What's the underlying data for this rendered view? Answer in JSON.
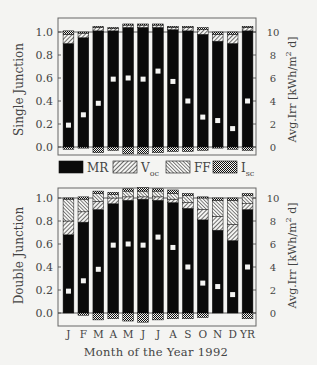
{
  "chart_data": [
    {
      "type": "bar",
      "stacked": true,
      "panel": "top",
      "ylabel": "Single Junction",
      "y2label": "Avg.Irr [kWh/m^2 d]",
      "ylim": [
        0.0,
        1.0
      ],
      "y2lim": [
        0,
        10
      ],
      "yticks": [
        "0.0",
        "0.2",
        "0.4",
        "0.6",
        "0.8",
        "1.0"
      ],
      "y2ticks": [
        "0",
        "2",
        "4",
        "6",
        "8",
        "10"
      ],
      "categories": [
        "J",
        "F",
        "M",
        "A",
        "M",
        "J",
        "J",
        "A",
        "S",
        "O",
        "N",
        "D",
        "YR"
      ],
      "series": [
        {
          "name": "MR",
          "values": [
            0.9,
            0.95,
            1.01,
            1.01,
            1.04,
            1.04,
            1.04,
            1.02,
            1.01,
            0.98,
            0.92,
            0.9,
            1.01
          ]
        },
        {
          "name": "Voc",
          "values": [
            0.08,
            0.04,
            0.03,
            0.02,
            0.02,
            0.02,
            0.02,
            0.02,
            0.03,
            0.04,
            0.06,
            0.08,
            0.03
          ]
        },
        {
          "name": "FF",
          "values": [
            0.0,
            0.0,
            0.0,
            0.0,
            0.0,
            0.0,
            0.0,
            0.0,
            0.0,
            0.0,
            0.0,
            0.0,
            0.0
          ]
        },
        {
          "name": "Isc",
          "values": [
            0.03,
            0.01,
            0.01,
            0.01,
            0.01,
            0.01,
            0.01,
            0.01,
            0.01,
            0.02,
            0.02,
            0.02,
            0.01
          ]
        },
        {
          "name": "Isc_below",
          "values": [
            -0.02,
            -0.01,
            -0.05,
            -0.03,
            -0.06,
            -0.06,
            -0.05,
            -0.04,
            -0.04,
            -0.03,
            -0.01,
            -0.02,
            -0.03
          ]
        }
      ],
      "irradiance": [
        1.9,
        2.8,
        3.8,
        5.9,
        6.0,
        5.9,
        6.6,
        5.7,
        4.0,
        2.6,
        2.3,
        1.6,
        4.0
      ]
    },
    {
      "type": "bar",
      "stacked": true,
      "panel": "bottom",
      "ylabel": "Double Junction",
      "y2label": "Avg.Irr [kWh/m^2 d]",
      "ylim": [
        0.0,
        1.0
      ],
      "y2lim": [
        0,
        10
      ],
      "yticks": [
        "0.0",
        "0.2",
        "0.4",
        "0.6",
        "0.8",
        "1.0"
      ],
      "y2ticks": [
        "0",
        "2",
        "4",
        "6",
        "8",
        "10"
      ],
      "categories": [
        "J",
        "F",
        "M",
        "A",
        "M",
        "J",
        "J",
        "A",
        "S",
        "O",
        "N",
        "D",
        "YR"
      ],
      "series": [
        {
          "name": "MR",
          "values": [
            0.68,
            0.79,
            0.9,
            0.95,
            0.98,
            0.99,
            0.98,
            0.96,
            0.91,
            0.81,
            0.72,
            0.63,
            0.9
          ]
        },
        {
          "name": "Voc",
          "values": [
            0.12,
            0.09,
            0.07,
            0.05,
            0.03,
            0.02,
            0.03,
            0.03,
            0.05,
            0.09,
            0.12,
            0.14,
            0.05
          ]
        },
        {
          "name": "FF",
          "values": [
            0.19,
            0.11,
            0.07,
            0.03,
            0.05,
            0.05,
            0.05,
            0.05,
            0.06,
            0.1,
            0.14,
            0.21,
            0.07
          ]
        },
        {
          "name": "Isc",
          "values": [
            0.01,
            0.02,
            0.02,
            0.02,
            0.02,
            0.03,
            0.02,
            0.03,
            0.02,
            0.01,
            0.02,
            0.02,
            0.02
          ]
        },
        {
          "name": "Isc_below",
          "values": [
            0.0,
            -0.02,
            -0.06,
            -0.05,
            -0.07,
            -0.08,
            -0.06,
            -0.05,
            -0.05,
            -0.04,
            0.0,
            0.0,
            -0.05
          ]
        }
      ],
      "irradiance": [
        1.9,
        2.8,
        3.8,
        5.9,
        6.0,
        5.9,
        6.6,
        5.7,
        4.0,
        2.6,
        2.3,
        1.6,
        4.0
      ]
    }
  ],
  "legend": {
    "items": [
      {
        "label": "MR",
        "sub": "",
        "pattern": "solid"
      },
      {
        "label": "V",
        "sub": "oc",
        "pattern": "hatch-fwd"
      },
      {
        "label": "FF",
        "sub": "",
        "pattern": "hatch-back"
      },
      {
        "label": "I",
        "sub": "sc",
        "pattern": "crosshatch"
      }
    ]
  },
  "xaxis": {
    "title": "Month of the Year 1992",
    "labels": [
      "J",
      "F",
      "M",
      "A",
      "M",
      "J",
      "J",
      "A",
      "S",
      "O",
      "N",
      "D",
      "YR"
    ]
  },
  "labels": {
    "top_ylabel": "Single Junction",
    "bottom_ylabel": "Double Junction",
    "y2label_main": "Avg.Irr [kWh/m",
    "y2label_sup": "2",
    "y2label_end": " d]"
  }
}
